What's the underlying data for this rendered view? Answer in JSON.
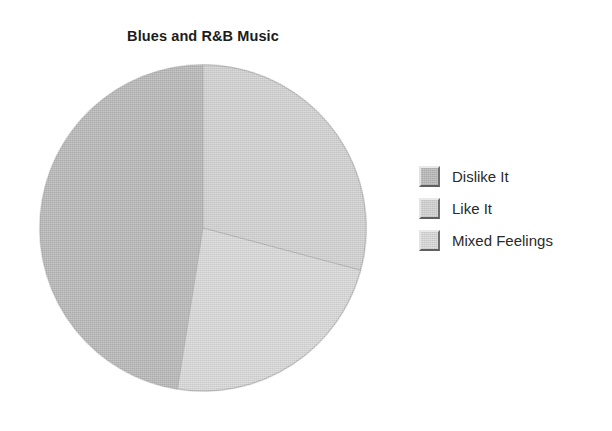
{
  "chart_data": {
    "type": "pie",
    "title": "Blues and R&B Music",
    "categories": [
      "Dislike It",
      "Like It",
      "Mixed Feelings"
    ],
    "values": [
      27,
      54,
      19
    ],
    "units": "percent",
    "start_angle_deg": 0,
    "direction": "mixed",
    "slices": [
      {
        "label": "Dislike It",
        "value": 27,
        "color": "#b4b4b4",
        "start_deg": 189,
        "end_deg": 360
      },
      {
        "label": "Like It",
        "value": 54,
        "color": "#cfcfcf",
        "start_deg": 0,
        "end_deg": 105
      },
      {
        "label": "Mixed Feelings",
        "value": 19,
        "color": "#d6d6d6",
        "start_deg": 105,
        "end_deg": 189
      }
    ],
    "legend_position": "right",
    "grid": false,
    "xlabel": "",
    "ylabel": "",
    "background_color": "#ffffff",
    "title_color": "#1c1c1c",
    "label_color": "#2a2a2a"
  },
  "legend": {
    "items": [
      {
        "label": "Dislike It",
        "color": "#b4b4b4"
      },
      {
        "label": "Like It",
        "color": "#cfcfcf"
      },
      {
        "label": "Mixed Feelings",
        "color": "#d6d6d6"
      }
    ]
  },
  "geometry": {
    "center_x": 164,
    "center_y": 164,
    "radius": 163
  }
}
